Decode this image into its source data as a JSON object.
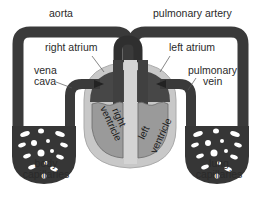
{
  "diagram": {
    "type": "circulatory-system",
    "labels": {
      "aorta": "aorta",
      "pulmonary_artery": "pulmonary artery",
      "right_atrium": "right atrium",
      "left_atrium": "left atrium",
      "vena_cava_line1": "vena",
      "vena_cava_line2": "cava",
      "pulmonary_vein_line1": "pulmonary",
      "pulmonary_vein_line2": "vein",
      "right_ventricle_line1": "right",
      "right_ventricle_line2": "ventricle",
      "left_ventricle_line1": "left",
      "left_ventricle_line2": "ventricle",
      "body_capillaries_line1": "body",
      "body_capillaries_line2": "capillaries",
      "lung_capillaries_line1": "lung",
      "lung_capillaries_line2": "capillaries"
    },
    "colors": {
      "vessel": "#3a3a3a",
      "heart_outer": "#c8c8c8",
      "atrium": "#4a4a4a",
      "ventricle": "#9a9a9a",
      "septum": "#d8d8d8",
      "text": "#2a2a2a"
    }
  }
}
